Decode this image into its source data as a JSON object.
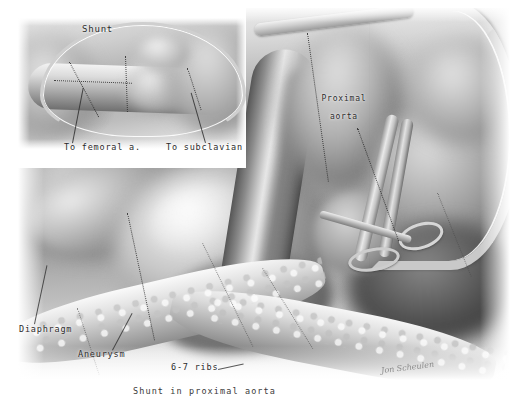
{
  "figure": {
    "title": "Shunt in proximal aorta",
    "caption": "Shunt in proximal aorta",
    "medium": "grayscale pencil and carbon-dust medical illustration",
    "signature": "Jon Scheulen",
    "background_color": "#ffffff",
    "ink_color": "#2b2b2b"
  },
  "inset": {
    "name": "shunt-detail-inset",
    "labels": {
      "shunt": "Shunt",
      "to_femoral": "To femoral a.",
      "to_subclavian": "To subclavian"
    }
  },
  "main": {
    "name": "operative-field",
    "labels": {
      "proximal_aorta": "Proximal\naorta",
      "proximal_aorta_line1": "Proximal",
      "proximal_aorta_line2": "aorta",
      "diaphragm": "Diaphragm",
      "aneurysm": "Aneurysm",
      "ribs": "6-7 ribs"
    }
  }
}
